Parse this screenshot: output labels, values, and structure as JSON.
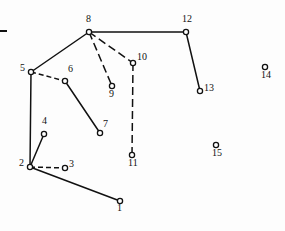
{
  "figure": {
    "title": "",
    "background_color": "#fdfdfd",
    "stroke_color": "#111111",
    "node_fill_color": "#ffffff",
    "width": 285,
    "height": 231
  },
  "chart_data": {
    "type": "scatter",
    "title": "",
    "xlabel": "",
    "ylabel": "",
    "grid": false,
    "legend": null,
    "nodes": [
      {
        "id": "1",
        "label": "1",
        "x": 120,
        "y": 201,
        "label_dx": -3,
        "label_dy": 7
      },
      {
        "id": "2",
        "label": "2",
        "x": 30,
        "y": 167,
        "label_dx": -11,
        "label_dy": -4
      },
      {
        "id": "3",
        "label": "3",
        "x": 65,
        "y": 168,
        "label_dx": 4,
        "label_dy": -4
      },
      {
        "id": "4",
        "label": "4",
        "x": 44,
        "y": 134,
        "label_dx": -2,
        "label_dy": -13
      },
      {
        "id": "5",
        "label": "5",
        "x": 31,
        "y": 72,
        "label_dx": -11,
        "label_dy": -4
      },
      {
        "id": "6",
        "label": "6",
        "x": 65,
        "y": 81,
        "label_dx": 3,
        "label_dy": -12
      },
      {
        "id": "7",
        "label": "7",
        "x": 100,
        "y": 133,
        "label_dx": 3,
        "label_dy": -9
      },
      {
        "id": "8",
        "label": "8",
        "x": 89,
        "y": 32,
        "label_dx": -3,
        "label_dy": -13
      },
      {
        "id": "9",
        "label": "9",
        "x": 112,
        "y": 86,
        "label_dx": -3,
        "label_dy": 8
      },
      {
        "id": "10",
        "label": "10",
        "x": 133,
        "y": 63,
        "label_dx": 4,
        "label_dy": -6
      },
      {
        "id": "11",
        "label": "11",
        "x": 132,
        "y": 155,
        "label_dx": -4,
        "label_dy": 8
      },
      {
        "id": "12",
        "label": "12",
        "x": 186,
        "y": 32,
        "label_dx": -4,
        "label_dy": -13
      },
      {
        "id": "13",
        "label": "13",
        "x": 200,
        "y": 91,
        "label_dx": 4,
        "label_dy": -3
      },
      {
        "id": "14",
        "label": "14",
        "x": 265,
        "y": 67,
        "label_dx": -4,
        "label_dy": 8
      },
      {
        "id": "15",
        "label": "15",
        "x": 216,
        "y": 145,
        "label_dx": -4,
        "label_dy": 8
      }
    ],
    "edges": [
      {
        "from": "2",
        "to": "1",
        "style": "solid"
      },
      {
        "from": "2",
        "to": "3",
        "style": "dashed"
      },
      {
        "from": "2",
        "to": "4",
        "style": "solid"
      },
      {
        "from": "2",
        "to": "5",
        "style": "solid"
      },
      {
        "from": "5",
        "to": "6",
        "style": "dashed"
      },
      {
        "from": "5",
        "to": "8",
        "style": "solid"
      },
      {
        "from": "6",
        "to": "7",
        "style": "solid"
      },
      {
        "from": "8",
        "to": "9",
        "style": "dashed-long"
      },
      {
        "from": "8",
        "to": "10",
        "style": "dashed-long"
      },
      {
        "from": "8",
        "to": "12",
        "style": "solid"
      },
      {
        "from": "10",
        "to": "11",
        "style": "dashed-long"
      },
      {
        "from": "12",
        "to": "13",
        "style": "solid"
      }
    ],
    "isolated_nodes": [
      "14",
      "15"
    ],
    "marks": [
      {
        "name": "left-edge-tick",
        "x1": 0,
        "y1": 31,
        "x2": 7,
        "y2": 31
      }
    ]
  }
}
